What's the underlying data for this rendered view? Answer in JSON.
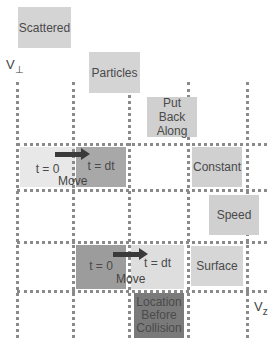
{
  "diagram": {
    "axes": {
      "vertical_label": "V",
      "vertical_sub": "⊥",
      "horizontal_label": "V",
      "horizontal_sub": "z"
    },
    "title_boxes": [
      {
        "id": "scattered",
        "text": "Scattered",
        "color": "#d4d4d4"
      },
      {
        "id": "particles",
        "text": "Particles",
        "color": "#d4d4d4"
      },
      {
        "id": "put-back-along",
        "text": "Put Back Along",
        "color": "#d0d0d0"
      },
      {
        "id": "constant",
        "text": "Constant",
        "color": "#d0d0d0"
      },
      {
        "id": "speed",
        "text": "Speed",
        "color": "#d0d0d0"
      },
      {
        "id": "surface",
        "text": "Surface",
        "color": "#d6d6d6"
      }
    ],
    "top_row": {
      "start_cell": {
        "text": "t = 0",
        "color": "#e8e8e8"
      },
      "end_cell": {
        "text": "t = dt",
        "color": "#a8a8a8"
      },
      "arrow_label": "Move"
    },
    "bottom_row": {
      "start_cell": {
        "text": "t = 0",
        "color": "#9c9c9c"
      },
      "end_cell": {
        "text": "t = dt",
        "color": "#dedede"
      },
      "arrow_label": "Move"
    },
    "location_box": {
      "text": "Location Before Collision",
      "line1": "Location",
      "line2": "Before",
      "line3": "Collision",
      "color": "#7a7a7a"
    }
  }
}
